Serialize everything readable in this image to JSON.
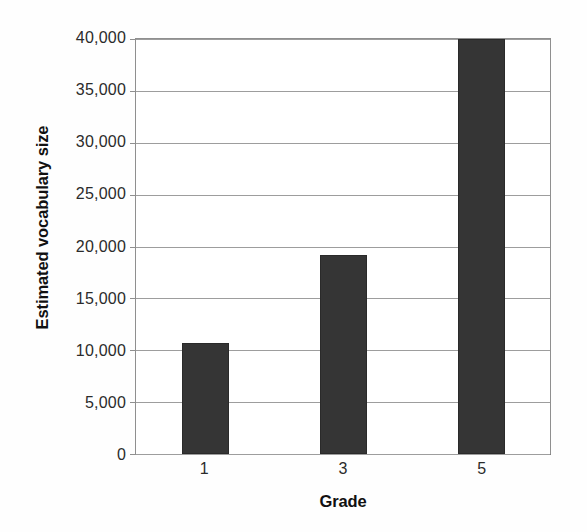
{
  "chart_data": {
    "type": "bar",
    "title": "",
    "subtitle": "",
    "categories": [
      "1",
      "3",
      "5"
    ],
    "values": [
      10700,
      19200,
      40000
    ],
    "series": [
      {
        "name": "Estimated vocabulary size",
        "values": [
          10700,
          19200,
          40000
        ]
      }
    ],
    "xlabel": "Grade",
    "ylabel": "Estimated vocabulary size",
    "ylim": [
      0,
      40000
    ],
    "ytick_values": [
      0,
      5000,
      10000,
      15000,
      20000,
      25000,
      30000,
      35000,
      40000
    ],
    "ytick_labels": [
      "0",
      "5,000",
      "10,000",
      "15,000",
      "20,000",
      "25,000",
      "30,000",
      "35,000",
      "40,000"
    ],
    "xtick_labels": [
      "1",
      "3",
      "5"
    ],
    "grid": true,
    "grid_axis": "y",
    "legend": false,
    "legend_position": "none",
    "annotations": [],
    "colors": {
      "bar_fill": "#353535",
      "bar_edge": "#2a2a2a",
      "gridline": "#9d9d9d",
      "axis_line": "#8f8f8f",
      "tick_label": "#2b2b2b",
      "axis_title": "#111111",
      "background": "#ffffff"
    }
  }
}
